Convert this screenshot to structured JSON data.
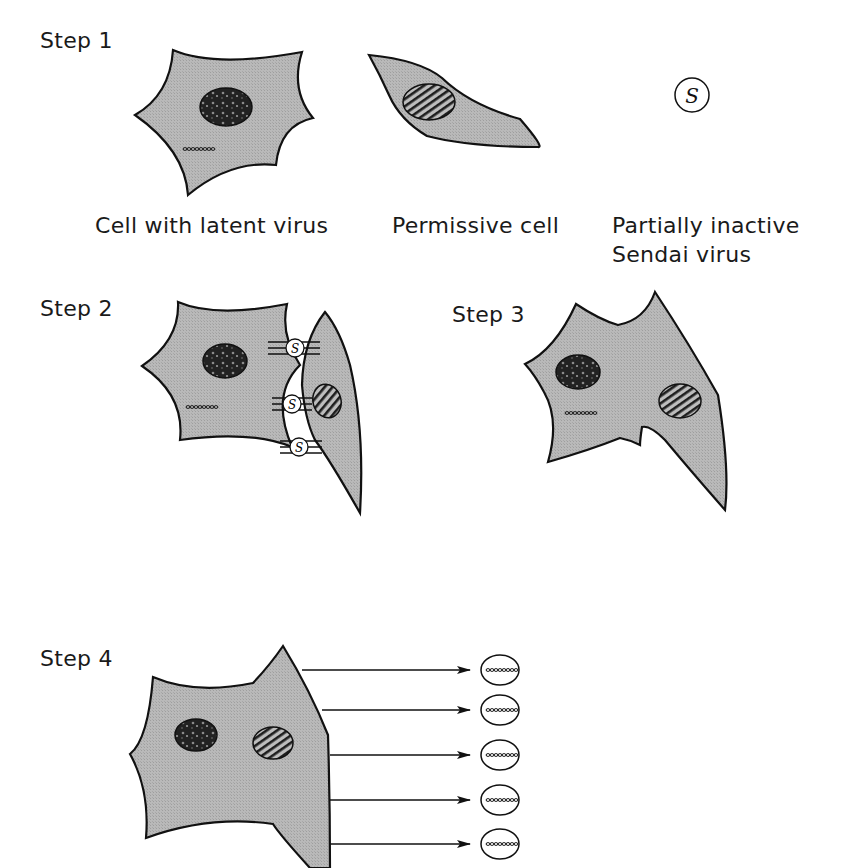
{
  "diagram": {
    "colors": {
      "cell_fill": "#b8b8b8",
      "outline": "#111111",
      "nucleus_dark": "#2a2a2a",
      "background": "#ffffff"
    },
    "steps": [
      {
        "label": "Step 1",
        "captions": [
          "Cell with latent virus",
          "Permissive cell",
          "Partially inactive",
          "Sendai virus"
        ]
      },
      {
        "label": "Step 2"
      },
      {
        "label": "Step 3"
      },
      {
        "label": "Step 4"
      }
    ],
    "virus_symbol": "S",
    "released_virions_count": 5
  }
}
